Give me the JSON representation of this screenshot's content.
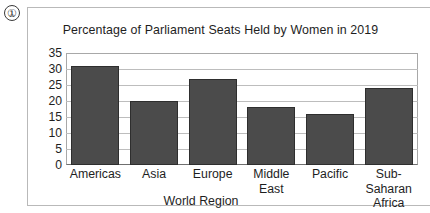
{
  "marker": {
    "label": "①"
  },
  "chart_data": {
    "type": "bar",
    "title": "Percentage of Parliament Seats Held by Women in 2019",
    "xlabel": "World Region",
    "ylabel": "",
    "categories": [
      "Americas",
      "Asia",
      "Europe",
      "Middle East",
      "Pacific",
      "Sub-Saharan Africa"
    ],
    "category_lines": [
      [
        "Americas"
      ],
      [
        "Asia"
      ],
      [
        "Europe"
      ],
      [
        "Middle East"
      ],
      [
        "Pacific"
      ],
      [
        "Sub-Saharan",
        "Africa"
      ]
    ],
    "values": [
      31,
      20,
      27,
      18,
      16,
      24
    ],
    "ylim": [
      0,
      35
    ],
    "ytick_labels": [
      "35",
      "30",
      "25",
      "20",
      "15",
      "10",
      "5",
      "0"
    ],
    "ytick_values": [
      35,
      30,
      25,
      20,
      15,
      10,
      5,
      0
    ],
    "grid": true,
    "legend": "none",
    "bar_color": "#4b4b4b",
    "bar_edge_color": "#2e2e2e",
    "grid_color": "#bdbdbd",
    "axis_color": "#6f6f6f",
    "frame_color": "#b9b9b9",
    "text_color": "#1e1e1e"
  }
}
